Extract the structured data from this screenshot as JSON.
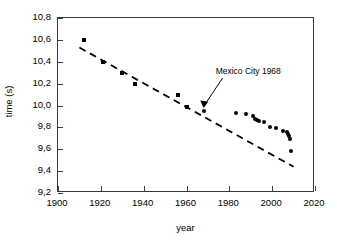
{
  "chart_data": {
    "type": "scatter",
    "title": "",
    "xlabel": "year",
    "ylabel": "time (s)",
    "xlim": [
      1900,
      2020
    ],
    "ylim": [
      9.2,
      10.8
    ],
    "xticks": [
      "1900",
      "1920",
      "1940",
      "1960",
      "1980",
      "2000",
      "2020"
    ],
    "xtick_values": [
      1900,
      1920,
      1940,
      1960,
      1980,
      2000,
      2020
    ],
    "yticks": [
      "9,2",
      "9,4",
      "9,6",
      "9,8",
      "10,0",
      "10,2",
      "10,4",
      "10,6",
      "10,8"
    ],
    "ytick_values": [
      9.2,
      9.4,
      9.6,
      9.8,
      10.0,
      10.2,
      10.4,
      10.6,
      10.8
    ],
    "grid": false,
    "legend": null,
    "decimal_separator": ",",
    "series": [
      {
        "name": "early records",
        "marker": "square",
        "color": "#000000",
        "points": [
          {
            "x": 1912,
            "y": 10.6
          },
          {
            "x": 1921,
            "y": 10.4
          },
          {
            "x": 1930,
            "y": 10.3
          },
          {
            "x": 1936,
            "y": 10.2
          },
          {
            "x": 1956,
            "y": 10.1
          },
          {
            "x": 1960,
            "y": 9.99
          }
        ]
      },
      {
        "name": "modern records",
        "marker": "circle",
        "color": "#000000",
        "points": [
          {
            "x": 1968,
            "y": 9.95
          },
          {
            "x": 1983,
            "y": 9.93
          },
          {
            "x": 1988,
            "y": 9.92
          },
          {
            "x": 1991,
            "y": 9.9
          },
          {
            "x": 1992,
            "y": 9.88
          },
          {
            "x": 1993,
            "y": 9.87
          },
          {
            "x": 1994,
            "y": 9.86
          },
          {
            "x": 1996,
            "y": 9.85
          },
          {
            "x": 1999,
            "y": 9.8
          },
          {
            "x": 2002,
            "y": 9.79
          },
          {
            "x": 2005,
            "y": 9.77
          },
          {
            "x": 2007,
            "y": 9.76
          },
          {
            "x": 2007.5,
            "y": 9.74
          },
          {
            "x": 2008,
            "y": 9.72
          },
          {
            "x": 2008.2,
            "y": 9.69
          },
          {
            "x": 2009,
            "y": 9.58
          }
        ]
      }
    ],
    "trendline": {
      "name": "linear trend",
      "style": "dashed",
      "color": "#000000",
      "x_start": 1910,
      "y_start": 10.53,
      "x_end": 2010,
      "y_end": 9.44
    },
    "annotations": [
      {
        "text": "Mexico City 1968",
        "target_x": 1968,
        "target_y": 9.95,
        "arrow": true
      }
    ]
  },
  "axes": {
    "x_title": "year",
    "y_title": "time (s)"
  }
}
